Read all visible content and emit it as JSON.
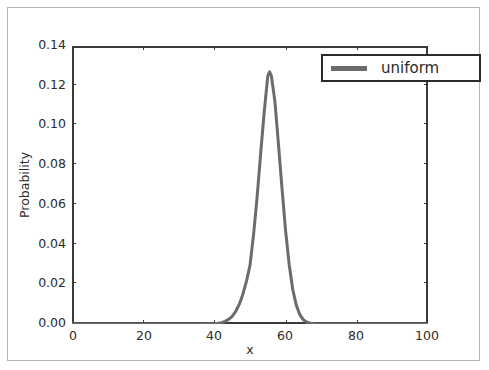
{
  "figure": {
    "background_color": "#ffffff",
    "frame_color": "#b4b4b4",
    "axis_color": "#3a3a3a"
  },
  "legend": {
    "entries": [
      {
        "label": "uniform",
        "color": "#6b6b6b"
      }
    ],
    "position": "upper right",
    "border_color": "#2b2b2b"
  },
  "chart_data": {
    "type": "line",
    "title": "",
    "xlabel": "x",
    "ylabel": "Probability",
    "xlim": [
      0,
      100
    ],
    "ylim": [
      0.0,
      0.14
    ],
    "grid": false,
    "legend_position": "upper right",
    "xticks": [
      0,
      20,
      40,
      60,
      80,
      100
    ],
    "xticklabels": [
      "0",
      "20",
      "40",
      "60",
      "80",
      "100"
    ],
    "yticks": [
      0.0,
      0.02,
      0.04,
      0.06,
      0.08,
      0.1,
      0.12,
      0.14
    ],
    "yticklabels": [
      "0.00",
      "0.02",
      "0.04",
      "0.06",
      "0.08",
      "0.10",
      "0.12",
      "0.14"
    ],
    "series": [
      {
        "name": "uniform",
        "color": "#6b6b6b",
        "linewidth": 3,
        "peak_x": 55.5,
        "peak_y": 0.127,
        "x": [
          0,
          2,
          4,
          6,
          8,
          10,
          12,
          14,
          16,
          18,
          20,
          22,
          24,
          26,
          28,
          30,
          32,
          34,
          36,
          38,
          40,
          41,
          42,
          43,
          44,
          45,
          46,
          47,
          48,
          49,
          50,
          51,
          52,
          53,
          54,
          55,
          55.5,
          56,
          57,
          58,
          59,
          60,
          61,
          62,
          63,
          64,
          65,
          66,
          67,
          68,
          70,
          72,
          74,
          76,
          78,
          80,
          84,
          88,
          92,
          96,
          100
        ],
        "y": [
          0.0,
          0.0,
          0.0,
          0.0,
          0.0,
          0.0,
          0.0,
          0.0,
          0.0,
          0.0,
          0.0,
          0.0,
          0.0,
          0.0,
          0.0,
          0.0,
          0.0,
          0.0,
          0.0,
          0.0001,
          0.0002,
          0.0004,
          0.0007,
          0.0013,
          0.0023,
          0.0039,
          0.0064,
          0.01,
          0.015,
          0.0215,
          0.0295,
          0.045,
          0.064,
          0.086,
          0.107,
          0.125,
          0.127,
          0.125,
          0.112,
          0.0905,
          0.068,
          0.047,
          0.03,
          0.0175,
          0.0095,
          0.0047,
          0.0021,
          0.0009,
          0.0004,
          0.0001,
          0.0,
          0.0,
          0.0,
          0.0,
          0.0,
          0.0,
          0.0,
          0.0,
          0.0,
          0.0,
          0.0
        ]
      }
    ]
  }
}
